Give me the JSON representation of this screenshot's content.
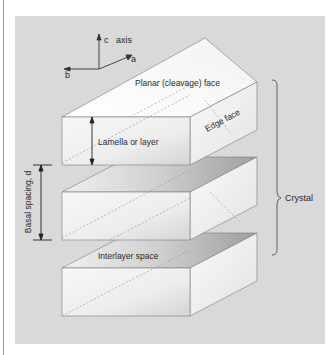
{
  "diagram": {
    "axis": {
      "label": "axis",
      "c": "c",
      "a": "a",
      "b": "b"
    },
    "labels": {
      "planar_face": "Planar (cleavage) face",
      "edge_face": "Edge face",
      "lamella": "Lamella or layer",
      "basal_spacing": "Basal spacing, d",
      "crystal": "Crystal",
      "interlayer": "Interlayer space"
    },
    "colors": {
      "panel": "#d9d9d9",
      "block_face": "#f4f4f4",
      "edge": "#6a6a6a",
      "text": "#2a2a2a"
    },
    "blocks": [
      {
        "id": "top",
        "front_top_y": 117,
        "height": 48
      },
      {
        "id": "middle",
        "front_top_y": 192,
        "height": 48
      },
      {
        "id": "bottom",
        "front_top_y": 268,
        "height": 48
      }
    ]
  }
}
